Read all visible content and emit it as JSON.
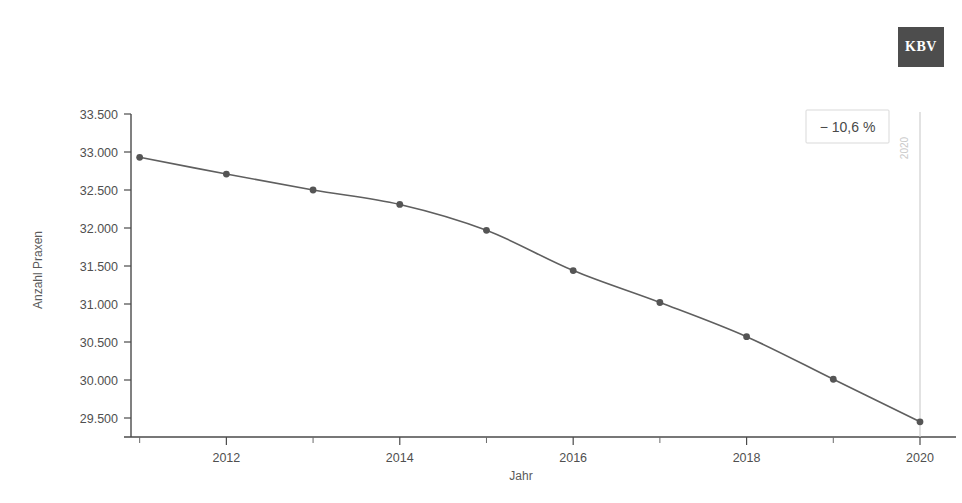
{
  "logo": {
    "text": "KBV",
    "bg_color": "#4d4d4d",
    "text_color": "#ffffff"
  },
  "annotation": {
    "label": "− 10,6 %",
    "border_color": "#d9d9d9",
    "text_color": "#4a4a4a"
  },
  "reference_line": {
    "label": "2020",
    "color": "#cfcfcf"
  },
  "chart_data": {
    "type": "line",
    "title": "",
    "xlabel": "Jahr",
    "ylabel": "Anzahl Praxen",
    "x": [
      2011,
      2012,
      2013,
      2014,
      2015,
      2016,
      2017,
      2018,
      2019,
      2020
    ],
    "values": [
      32930,
      32710,
      32500,
      32310,
      31970,
      31440,
      31020,
      30570,
      30010,
      29450
    ],
    "series": [
      {
        "name": "Anzahl Praxen",
        "values": [
          32930,
          32710,
          32500,
          32310,
          31970,
          31440,
          31020,
          30570,
          30010,
          29450
        ]
      }
    ],
    "xlim": [
      2010.9,
      2020
    ],
    "ylim": [
      29250,
      33500
    ],
    "xticks": [
      2012,
      2014,
      2016,
      2018,
      2020
    ],
    "xtick_labels": [
      "2012",
      "2014",
      "2016",
      "2018",
      "2020"
    ],
    "xminor_ticks": [
      2011,
      2013,
      2015,
      2017,
      2019
    ],
    "yticks": [
      29500,
      30000,
      30500,
      31000,
      31500,
      32000,
      32500,
      33000,
      33500
    ],
    "ytick_labels": [
      "29.500",
      "30.000",
      "30.500",
      "31.000",
      "31.500",
      "32.000",
      "32.500",
      "33.000",
      "33.500"
    ],
    "grid": false,
    "legend": null,
    "line_color": "#5f5f5f",
    "marker_color": "#555555",
    "annotations": [
      "− 10,6 %"
    ]
  }
}
